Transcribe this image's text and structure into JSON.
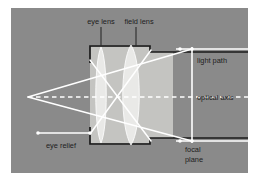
{
  "colors": {
    "page_background": "#ffffff",
    "diagram_background": "#8a8a8a",
    "tube_outline": "#1a1a1a",
    "lens_body": "#e9e9e6",
    "lens_outline": "#ffffff",
    "barrel_fill": "#cfcfcb",
    "ray_line": "#ffffff",
    "axis_line": "#ffffff",
    "label_text": "#1d1d1d",
    "leader_line": "#2a2a2a"
  },
  "labels": {
    "eye_lens": "eye lens",
    "field_lens": "field lens",
    "light_path": "light path",
    "optical_axis": "optical axis",
    "eye_relief": "eye relief",
    "focal_plane_line1": "focal",
    "focal_plane_line2": "plane"
  },
  "components": {
    "eye_lens": {
      "name": "eye lens",
      "type": "biconvex",
      "position_x": 101,
      "thickness": "thin"
    },
    "field_lens": {
      "name": "field lens",
      "type": "biconvex",
      "position_x": 131,
      "thickness": "thick"
    },
    "focal_plane": {
      "name": "focal plane",
      "position_x": 192,
      "orientation": "vertical"
    },
    "optical_axis": {
      "name": "optical axis",
      "position_y": 97,
      "style": "dashed"
    }
  },
  "geometry": {
    "canvas_width": 258,
    "canvas_height": 183,
    "diagram_rect": {
      "x": 11,
      "y": 8,
      "width": 237,
      "height": 165
    },
    "ray_apex": {
      "x": 28,
      "y": 97
    }
  }
}
